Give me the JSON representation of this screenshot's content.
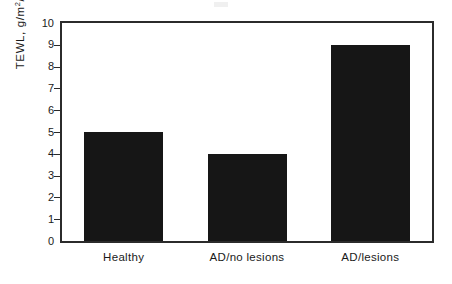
{
  "chart_data": {
    "type": "bar",
    "title": "",
    "subtitle": "",
    "xlabel": "",
    "ylabel": "TEWL, g/m²/h",
    "ylabel_prefix": "TEWL, g/m",
    "ylabel_exponent": "2",
    "ylabel_suffix": "/h",
    "categories": [
      "Healthy",
      "AD/no lesions",
      "AD/lesions"
    ],
    "values": [
      5,
      4,
      9
    ],
    "series": [
      {
        "name": "TEWL",
        "values": [
          5,
          4,
          9
        ]
      }
    ],
    "ylim": [
      0,
      10
    ],
    "xlim": [
      0,
      3
    ],
    "y_ticks": [
      0,
      1,
      2,
      3,
      4,
      5,
      6,
      7,
      8,
      9,
      10
    ],
    "y_tick_labels": [
      "0",
      "1",
      "2",
      "3",
      "4",
      "5",
      "6",
      "7",
      "8",
      "9",
      "10"
    ],
    "x_tick_labels": [
      "Healthy",
      "AD/no lesions",
      "AD/lesions"
    ],
    "grid": false,
    "legend": false,
    "legend_position": "none",
    "bar_color": "#161616",
    "axis_color": "#2b2b2b",
    "background_color": "#ffffff",
    "frame": "full-box",
    "tick_direction": "out",
    "annotations": []
  }
}
